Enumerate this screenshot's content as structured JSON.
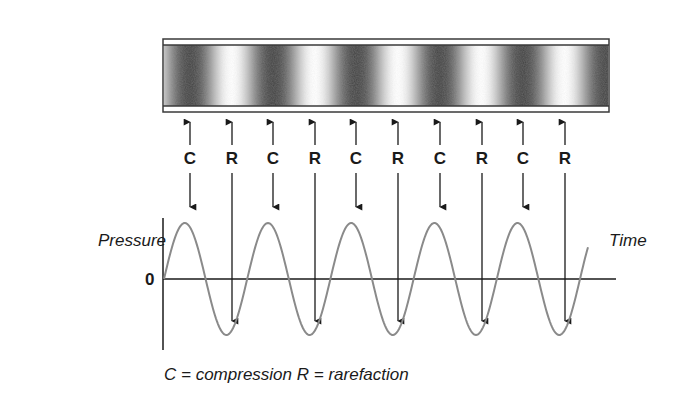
{
  "diagram": {
    "title": "",
    "tube": {
      "description": "air column with alternating compression and rarefaction bands",
      "bands": [
        "compression",
        "rarefaction",
        "compression",
        "rarefaction",
        "compression",
        "rarefaction",
        "compression",
        "rarefaction",
        "compression",
        "rarefaction"
      ]
    },
    "markers": [
      {
        "label": "C",
        "x": 190,
        "type": "compression"
      },
      {
        "label": "R",
        "x": 232,
        "type": "rarefaction"
      },
      {
        "label": "C",
        "x": 273,
        "type": "compression"
      },
      {
        "label": "R",
        "x": 315,
        "type": "rarefaction"
      },
      {
        "label": "C",
        "x": 356,
        "type": "compression"
      },
      {
        "label": "R",
        "x": 398,
        "type": "rarefaction"
      },
      {
        "label": "C",
        "x": 440,
        "type": "compression"
      },
      {
        "label": "R",
        "x": 482,
        "type": "rarefaction"
      },
      {
        "label": "C",
        "x": 523,
        "type": "compression"
      },
      {
        "label": "R",
        "x": 565,
        "type": "rarefaction"
      }
    ],
    "graph": {
      "y_label": "Pressure",
      "x_label": "Time",
      "zero_label": "0",
      "cycles": 5
    },
    "caption": "C = compression   R = rarefaction",
    "colors": {
      "ink": "#1a1a1a",
      "wave": "#8a8a8a",
      "tube_dark": "#3a3a3a",
      "tube_light": "#ffffff"
    }
  }
}
